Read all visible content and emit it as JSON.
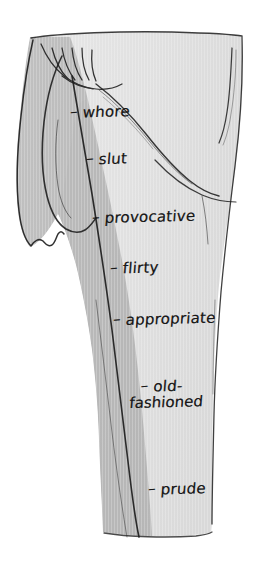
{
  "illustration": {
    "title": "Skirt-length judgement scale",
    "subject": "woman wearing a skirt, side view",
    "style": "hand-drawn pen-and-ink with gray wash",
    "background_color": "#ffffff",
    "fabric_light_color": "#e2e2e2",
    "fabric_mid_color": "#b9b9b9",
    "fabric_shadow_color": "#cfcfcf",
    "ink_color": "#1a1a1a",
    "label_dash": "–"
  },
  "labels": [
    {
      "id": "whore",
      "text": "whore",
      "dash": "–",
      "x": 70,
      "y": 105,
      "hem_height_rank": 1
    },
    {
      "id": "slut",
      "text": "slut",
      "dash": "–",
      "x": 86,
      "y": 152,
      "hem_height_rank": 2
    },
    {
      "id": "provocative",
      "text": "provocative",
      "dash": "–",
      "x": 92,
      "y": 210,
      "hem_height_rank": 3
    },
    {
      "id": "flirty",
      "text": "flirty",
      "dash": "–",
      "x": 110,
      "y": 261,
      "hem_height_rank": 4
    },
    {
      "id": "appropriate",
      "text": "appropriate",
      "dash": "–",
      "x": 113,
      "y": 312,
      "hem_height_rank": 5
    },
    {
      "id": "old-fashioned",
      "text": "old-",
      "text_line2": "fashioned",
      "dash": "–",
      "x": 140,
      "y": 379,
      "hem_height_rank": 6,
      "two_line": true
    },
    {
      "id": "prude",
      "text": "prude",
      "dash": "–",
      "x": 148,
      "y": 482,
      "hem_height_rank": 7
    }
  ]
}
